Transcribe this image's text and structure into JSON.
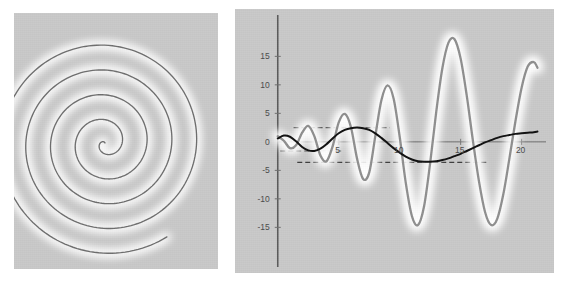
{
  "figure": {
    "background_color": "#ffffff",
    "panel_background_color": "#c9c9c9",
    "panel_count": 2
  },
  "chart_data": [
    {
      "id": "spiral-plot",
      "type": "line",
      "title": "",
      "xlabel": "",
      "ylabel": "",
      "axes_visible": false,
      "grid": false,
      "legend": null,
      "description": "Archimedean spiral, parametric curve r = a*theta drawn counter-clockwise over roughly 4.5 turns, ending at upper right with a glow highlight at the free end.",
      "parametric": {
        "r_of_theta": "0.0255 * theta",
        "theta_start": 0.0,
        "theta_end": 28.5,
        "turns": 4.5,
        "center_px": [
          105,
          143
        ]
      },
      "series": [
        {
          "name": "spiral",
          "color": "#6e6e6e",
          "linewidth": 1.3,
          "glow": true,
          "glow_color": "#ffffff"
        }
      ]
    },
    {
      "id": "wave-plot",
      "type": "line",
      "title": "",
      "xlabel": "",
      "ylabel": "",
      "grid": false,
      "legend": null,
      "xlim": [
        -0.8,
        22.0
      ],
      "ylim": [
        -19.5,
        20.5
      ],
      "xticks": [
        5,
        10,
        15,
        20
      ],
      "xtick_labels": [
        "5",
        "10",
        "15",
        "20"
      ],
      "yticks": [
        15,
        10,
        5,
        0,
        -5,
        -10,
        -15
      ],
      "ytick_labels": [
        "15",
        "10",
        "5",
        "0",
        "-5",
        "-10",
        "-15"
      ],
      "zero_line": true,
      "y_axis_line": true,
      "series": [
        {
          "name": "growing-oscillation",
          "color": "#8f8f8f",
          "linewidth": 2.2,
          "glow": true,
          "glow_color": "#ffffff",
          "description": "Chirped sinusoid with linearly growing amplitude, roughly x*sin(x) / Bessel-like envelope.",
          "x": [
            0,
            0.5,
            1,
            1.5,
            2,
            2.5,
            3,
            3.5,
            4,
            4.5,
            5,
            5.5,
            6,
            6.5,
            7,
            7.5,
            8,
            8.5,
            9,
            9.5,
            10,
            10.5,
            11,
            11.5,
            12,
            12.5,
            13,
            13.5,
            14,
            14.5,
            15,
            15.5,
            16,
            16.5,
            17,
            17.5,
            18,
            18.5,
            19,
            19.5,
            20,
            20.5,
            21,
            21.3
          ],
          "y": [
            1.0,
            0.2,
            -1.1,
            -0.6,
            1.6,
            2.8,
            1.0,
            -2.4,
            -3.4,
            -0.8,
            3.4,
            4.9,
            2.6,
            -2.9,
            -6.5,
            -5.4,
            1.0,
            7.3,
            9.9,
            7.6,
            0.9,
            -7.2,
            -13.0,
            -14.6,
            -11.3,
            -3.7,
            5.3,
            12.9,
            17.4,
            18.0,
            14.6,
            8.1,
            0.3,
            -6.9,
            -12.3,
            -14.6,
            -13.5,
            -9.2,
            -2.9,
            3.7,
            9.5,
            13.2,
            14.0,
            13.0
          ]
        },
        {
          "name": "slow-envelope-wave",
          "color": "#111111",
          "linewidth": 2.0,
          "glow": false,
          "description": "Low frequency damped-looking sinusoid oscillating between about +2.5 and -3.5.",
          "x": [
            0,
            0.5,
            1,
            1.5,
            2,
            2.5,
            3,
            3.5,
            4,
            4.5,
            5,
            5.5,
            6,
            6.5,
            7,
            7.5,
            8,
            8.5,
            9,
            9.5,
            10,
            10.5,
            11,
            11.5,
            12,
            12.5,
            13,
            13.5,
            14,
            14.5,
            15,
            15.5,
            16,
            16.5,
            17,
            17.5,
            18,
            18.5,
            19,
            19.5,
            20,
            20.5,
            21,
            21.3
          ],
          "y": [
            0.6,
            1.1,
            0.9,
            0.1,
            -0.9,
            -1.5,
            -1.6,
            -1.2,
            -0.4,
            0.6,
            1.5,
            2.1,
            2.4,
            2.5,
            2.4,
            2.1,
            1.5,
            0.7,
            -0.2,
            -1.1,
            -1.9,
            -2.6,
            -3.1,
            -3.4,
            -3.5,
            -3.5,
            -3.4,
            -3.2,
            -2.9,
            -2.5,
            -2.1,
            -1.6,
            -1.1,
            -0.6,
            -0.1,
            0.3,
            0.7,
            1.0,
            1.2,
            1.4,
            1.5,
            1.6,
            1.7,
            1.8
          ]
        }
      ],
      "reference_lines": [
        {
          "name": "upper-dashed",
          "y": 2.5,
          "x_from": 1.3,
          "x_to": 9.2,
          "style": "dashed",
          "color": "#3f3f3f"
        },
        {
          "name": "mid-dashed",
          "y": -1.6,
          "x_from": 0.2,
          "x_to": 5.2,
          "style": "dashed",
          "color": "#3f3f3f"
        },
        {
          "name": "lower-dashed",
          "y": -3.6,
          "x_from": 1.6,
          "x_to": 17.2,
          "style": "dashed",
          "color": "#3f3f3f"
        }
      ]
    }
  ]
}
